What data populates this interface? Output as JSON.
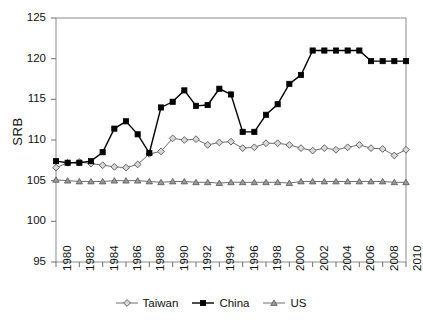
{
  "chart_data": {
    "type": "line",
    "title": "",
    "xlabel": "",
    "ylabel": "SRB",
    "xlim": [
      1980,
      2010
    ],
    "ylim": [
      95,
      125
    ],
    "yticks": [
      95,
      100,
      105,
      110,
      115,
      120,
      125
    ],
    "xticks": [
      1980,
      1982,
      1984,
      1986,
      1988,
      1990,
      1992,
      1994,
      1996,
      1998,
      2000,
      2002,
      2004,
      2006,
      2008,
      2010
    ],
    "grid": false,
    "legend_position": "bottom-center",
    "x": [
      1980,
      1981,
      1982,
      1983,
      1984,
      1985,
      1986,
      1987,
      1988,
      1989,
      1990,
      1991,
      1992,
      1993,
      1994,
      1995,
      1996,
      1997,
      1998,
      1999,
      2000,
      2001,
      2002,
      2003,
      2004,
      2005,
      2006,
      2007,
      2008,
      2009,
      2010
    ],
    "series": [
      {
        "name": "Taiwan",
        "marker": "diamond",
        "color": "#9a9a9a",
        "line_color": "#6e6e6e",
        "values": [
          106.6,
          107.2,
          107.3,
          107.1,
          106.9,
          106.7,
          106.6,
          107.0,
          108.3,
          108.6,
          110.2,
          110.0,
          110.1,
          109.4,
          109.7,
          109.8,
          109.0,
          109.1,
          109.6,
          109.6,
          109.4,
          109.0,
          108.7,
          109.0,
          108.8,
          109.1,
          109.4,
          109.0,
          108.9,
          108.1,
          108.8
        ]
      },
      {
        "name": "China",
        "marker": "square-filled",
        "color": "#000000",
        "line_color": "#000000",
        "values": [
          107.4,
          107.2,
          107.2,
          107.4,
          108.5,
          111.4,
          112.3,
          110.7,
          108.4,
          114.0,
          114.7,
          116.1,
          114.2,
          114.3,
          116.3,
          115.6,
          111.0,
          111.0,
          113.1,
          114.4,
          116.9,
          118.0,
          121.0,
          121.0,
          121.0,
          121.0,
          121.0,
          119.7,
          119.7,
          119.7,
          119.7
        ]
      },
      {
        "name": "US",
        "marker": "triangle",
        "color": "#777777",
        "line_color": "#6e6e6e",
        "values": [
          105.1,
          105.0,
          104.9,
          104.9,
          104.9,
          105.0,
          105.0,
          105.0,
          104.9,
          104.8,
          104.9,
          104.9,
          104.8,
          104.8,
          104.7,
          104.8,
          104.8,
          104.8,
          104.8,
          104.8,
          104.7,
          104.9,
          104.9,
          104.9,
          104.9,
          104.9,
          104.9,
          104.9,
          104.9,
          104.8,
          104.8
        ]
      }
    ]
  },
  "axis": {
    "y_title": "SRB"
  },
  "legend": {
    "items": [
      {
        "label": "Taiwan"
      },
      {
        "label": "China"
      },
      {
        "label": "US"
      }
    ]
  }
}
